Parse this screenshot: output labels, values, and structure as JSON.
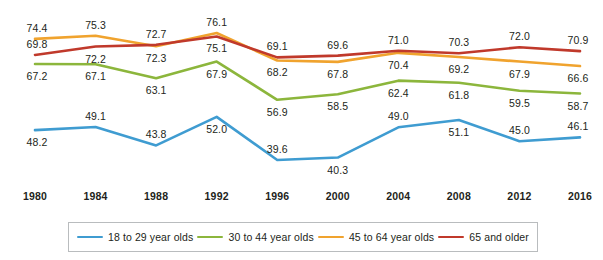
{
  "chart_data": {
    "type": "line",
    "title": "",
    "subtitle": "",
    "xlabel": "",
    "ylabel": "",
    "grid": false,
    "legend_position": "bottom",
    "categories": [
      "1980",
      "1984",
      "1988",
      "1992",
      "1996",
      "2000",
      "2004",
      "2008",
      "2012",
      "2016"
    ],
    "x": [
      1980,
      1984,
      1988,
      1992,
      1996,
      2000,
      2004,
      2008,
      2012,
      2016
    ],
    "ylim": [
      35,
      80
    ],
    "series": [
      {
        "name": "18 to 29 year olds",
        "color": "#3f9cd1",
        "values": [
          48.2,
          49.1,
          43.8,
          52.0,
          39.6,
          40.3,
          49.0,
          51.1,
          45.0,
          46.1
        ],
        "label_positions": [
          "below",
          "above",
          "above",
          "below",
          "above",
          "below",
          "above",
          "below",
          "above",
          "above"
        ]
      },
      {
        "name": "30 to 44 year olds",
        "color": "#8cb63c",
        "values": [
          67.2,
          67.1,
          63.1,
          67.9,
          56.9,
          58.5,
          62.4,
          61.8,
          59.5,
          58.7
        ],
        "label_positions": [
          "below",
          "below",
          "below",
          "below",
          "below",
          "below",
          "below",
          "below",
          "below",
          "below"
        ]
      },
      {
        "name": "45 to 64 year olds",
        "color": "#f0a32e",
        "values": [
          74.4,
          75.3,
          72.3,
          76.1,
          68.2,
          67.8,
          70.4,
          69.2,
          67.9,
          66.6
        ],
        "label_positions": [
          "above",
          "above",
          "below",
          "above",
          "below",
          "below",
          "below",
          "below",
          "below",
          "below"
        ]
      },
      {
        "name": "65 and older",
        "color": "#c0392b",
        "values": [
          69.8,
          72.2,
          72.7,
          75.1,
          69.1,
          69.6,
          71.0,
          70.3,
          72.0,
          70.9
        ],
        "label_positions": [
          "above",
          "below",
          "above",
          "below",
          "above",
          "above",
          "above",
          "above",
          "above",
          "above"
        ]
      }
    ]
  },
  "legend": {
    "items": [
      {
        "label": "18 to 29 year olds",
        "color": "#3f9cd1"
      },
      {
        "label": "30 to 44 year olds",
        "color": "#8cb63c"
      },
      {
        "label": "45 to 64 year olds",
        "color": "#f0a32e"
      },
      {
        "label": "65 and older",
        "color": "#c0392b"
      }
    ]
  }
}
